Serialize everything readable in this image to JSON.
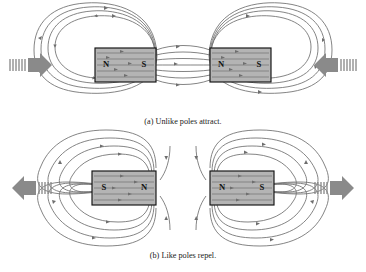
{
  "figure": {
    "background_color": "#ffffff",
    "field_line_color": "#6e6e6e",
    "magnet_fill_color": "#b4b4b4",
    "magnet_border_color": "#121212",
    "force_arrow_color": "#8a8a8a"
  },
  "panels": [
    {
      "id": "panel-a",
      "caption": "(a) Unlike poles attract.",
      "interaction": "attract",
      "force_arrows": [
        {
          "side": "left",
          "direction": "right",
          "label": "attraction-force-left"
        },
        {
          "side": "right",
          "direction": "left",
          "label": "attraction-force-right"
        }
      ],
      "magnets": [
        {
          "position": "left",
          "left_pole": "N",
          "right_pole": "S"
        },
        {
          "position": "right",
          "left_pole": "N",
          "right_pole": "S"
        }
      ],
      "gap_field": "continuous lines cross the gap from S to N",
      "outer_loops": 4
    },
    {
      "id": "panel-b",
      "caption": "(b) Like poles repel.",
      "interaction": "repel",
      "force_arrows": [
        {
          "side": "left",
          "direction": "left",
          "label": "repulsion-force-left"
        },
        {
          "side": "right",
          "direction": "right",
          "label": "repulsion-force-right"
        }
      ],
      "magnets": [
        {
          "position": "left",
          "left_pole": "S",
          "right_pole": "N"
        },
        {
          "position": "right",
          "left_pole": "N",
          "right_pole": "S"
        }
      ],
      "gap_field": "lines curve away from the gap leaving a neutral zone",
      "outer_loops": 4
    }
  ]
}
